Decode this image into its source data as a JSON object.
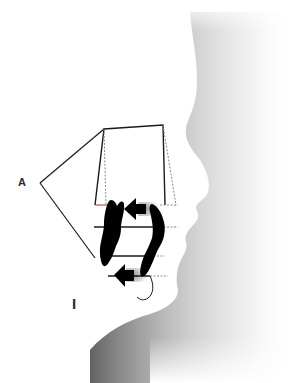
{
  "diagram": {
    "type": "dental-profile-diagram",
    "labels": {
      "a": "A",
      "i": "I"
    },
    "colors": {
      "line": "#1a1a1a",
      "dotted_line": "#8a8a8a",
      "tooth_fill": "#000000",
      "face_shadow": "#6e6e6e",
      "background": "#ffffff"
    },
    "elements": [
      "facial-profile-silhouette",
      "trapezoid-frame",
      "upper-incisor",
      "lower-incisor",
      "upper-arrow",
      "lower-arrow",
      "horizontal-reference-lines",
      "angle-lines"
    ]
  }
}
